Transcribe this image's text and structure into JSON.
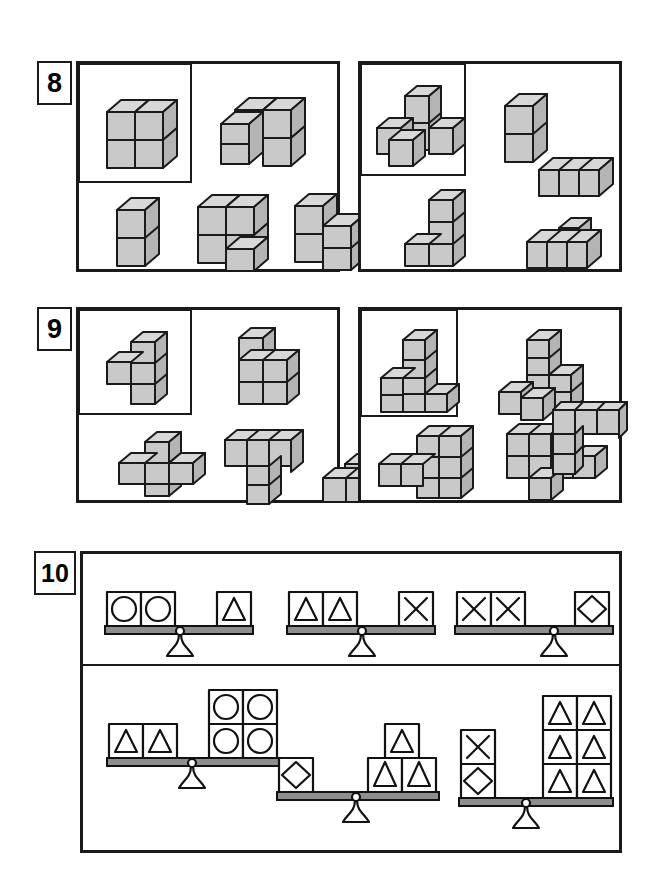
{
  "worksheet": {
    "title": "Spatial reasoning worksheet: cube stacks and balance scales",
    "background": "#ffffff",
    "ink": "#1a1a1a",
    "cube_face_color": "#c9c9c9",
    "cube_top_color": "#d8d8d8",
    "cube_side_color": "#b4b4b4",
    "beam_color": "#909090"
  },
  "problems": [
    {
      "number": "8",
      "label": "8",
      "type": "cube-stacks",
      "panels": [
        {
          "id": "8-left",
          "reference": {
            "name": "2x2x2-cube",
            "description": "solid 2 by 2 by 2 cube of 8 blocks",
            "cubes": [
              [
                0,
                0,
                0
              ],
              [
                1,
                0,
                0
              ],
              [
                0,
                1,
                0
              ],
              [
                1,
                1,
                0
              ],
              [
                0,
                0,
                1
              ],
              [
                1,
                0,
                1
              ],
              [
                0,
                1,
                1
              ],
              [
                1,
                1,
                1
              ]
            ]
          },
          "candidates": [
            {
              "name": "l-shaped-6-block",
              "description": "two stacked blocks with an L-foot, 6 blocks",
              "cubes": [
                [
                  0,
                  0,
                  0
                ],
                [
                  1,
                  0,
                  0
                ],
                [
                  1,
                  1,
                  0
                ],
                [
                  0,
                  0,
                  1
                ],
                [
                  1,
                  0,
                  1
                ],
                [
                  1,
                  1,
                  1
                ]
              ]
            },
            {
              "name": "vertical-domino",
              "description": "two blocks stacked vertically",
              "cubes": [
                [
                  0,
                  0,
                  0
                ],
                [
                  0,
                  0,
                  1
                ]
              ]
            },
            {
              "name": "stair-4-block",
              "description": "three blocks in an L plus one in front, 4 blocks",
              "cubes": [
                [
                  0,
                  0,
                  0
                ],
                [
                  1,
                  0,
                  0
                ],
                [
                  0,
                  0,
                  1
                ],
                [
                  1,
                  0,
                  1
                ]
              ]
            },
            {
              "name": "offset-stack-5-block",
              "description": "column of two with a step at the right",
              "cubes": [
                [
                  0,
                  0,
                  0
                ],
                [
                  0,
                  0,
                  1
                ],
                [
                  1,
                  0,
                  0
                ],
                [
                  1,
                  1,
                  0
                ]
              ]
            }
          ]
        },
        {
          "id": "8-right",
          "reference": {
            "name": "t-tetromino-3d",
            "description": "a tall 2-block column sitting on a row of three blocks",
            "cubes": [
              [
                0,
                0,
                0
              ],
              [
                1,
                0,
                0
              ],
              [
                2,
                0,
                0
              ],
              [
                1,
                0,
                1
              ],
              [
                1,
                0,
                2
              ]
            ]
          },
          "candidates": [
            {
              "name": "vertical-domino",
              "description": "two blocks stacked vertically",
              "cubes": [
                [
                  0,
                  0,
                  0
                ],
                [
                  0,
                  0,
                  1
                ]
              ]
            },
            {
              "name": "row-of-three",
              "description": "three blocks in a straight row",
              "cubes": [
                [
                  0,
                  0,
                  0
                ],
                [
                  1,
                  0,
                  0
                ],
                [
                  2,
                  0,
                  0
                ]
              ]
            },
            {
              "name": "l-column-4-block",
              "description": "column of three with one block at the bottom left",
              "cubes": [
                [
                  1,
                  0,
                  0
                ],
                [
                  1,
                  0,
                  1
                ],
                [
                  1,
                  0,
                  2
                ],
                [
                  0,
                  0,
                  0
                ]
              ]
            },
            {
              "name": "row-of-three-plus-top",
              "description": "row of three blocks with one block on top of the middle",
              "cubes": [
                [
                  0,
                  0,
                  0
                ],
                [
                  1,
                  0,
                  0
                ],
                [
                  2,
                  0,
                  0
                ],
                [
                  1,
                  0,
                  1
                ]
              ]
            }
          ]
        }
      ]
    },
    {
      "number": "9",
      "label": "9",
      "type": "cube-stacks",
      "panels": [
        {
          "id": "9-left",
          "reference": {
            "name": "plus-partial-5-block",
            "description": "vertical column of three with one block to the left of the middle",
            "cubes": [
              [
                1,
                0,
                0
              ],
              [
                1,
                0,
                1
              ],
              [
                1,
                0,
                2
              ],
              [
                0,
                0,
                1
              ]
            ]
          },
          "candidates": [
            {
              "name": "p-shape-5-block",
              "description": "two-by-two square of blocks with one extra on top left",
              "cubes": [
                [
                  0,
                  0,
                  0
                ],
                [
                  1,
                  0,
                  0
                ],
                [
                  0,
                  0,
                  1
                ],
                [
                  1,
                  0,
                  1
                ],
                [
                  0,
                  0,
                  2
                ]
              ]
            },
            {
              "name": "plus-shape-5-block",
              "description": "plus / cross made of five blocks",
              "cubes": [
                [
                  1,
                  0,
                  0
                ],
                [
                  0,
                  0,
                  1
                ],
                [
                  1,
                  0,
                  1
                ],
                [
                  2,
                  0,
                  1
                ],
                [
                  1,
                  0,
                  2
                ]
              ]
            },
            {
              "name": "t-shape-5-block",
              "description": "row of three blocks with a column of two hanging down from the middle",
              "cubes": [
                [
                  0,
                  0,
                  2
                ],
                [
                  1,
                  0,
                  2
                ],
                [
                  2,
                  0,
                  2
                ],
                [
                  1,
                  0,
                  1
                ],
                [
                  1,
                  0,
                  0
                ]
              ]
            },
            {
              "name": "pyramid-3-block",
              "description": "two blocks side by side with one on top",
              "cubes": [
                [
                  0,
                  0,
                  0
                ],
                [
                  1,
                  0,
                  0
                ],
                [
                  1,
                  0,
                  1
                ]
              ]
            }
          ]
        },
        {
          "id": "9-right",
          "reference": {
            "name": "l-block-6",
            "description": "column of three on the left with an L foot of blocks at the base",
            "cubes": [
              [
                0,
                0,
                0
              ],
              [
                1,
                0,
                0
              ],
              [
                2,
                0,
                0
              ],
              [
                0,
                0,
                1
              ],
              [
                0,
                0,
                2
              ],
              [
                1,
                0,
                1
              ]
            ]
          },
          "candidates": [
            {
              "name": "stepped-tower-7-block",
              "description": "tall tower with a lower step and a front block",
              "cubes": [
                [
                  0,
                  0,
                  0
                ],
                [
                  1,
                  0,
                  0
                ],
                [
                  1,
                  0,
                  1
                ],
                [
                  1,
                  0,
                  2
                ],
                [
                  2,
                  0,
                  0
                ],
                [
                  2,
                  0,
                  1
                ],
                [
                  0,
                  1,
                  0
                ]
              ]
            },
            {
              "name": "t-wide-7-block",
              "description": "wide block group with a tall 2x2 section",
              "cubes": [
                [
                  0,
                  0,
                  0
                ],
                [
                  1,
                  0,
                  0
                ],
                [
                  2,
                  0,
                  0
                ],
                [
                  3,
                  0,
                  0
                ],
                [
                  2,
                  0,
                  1
                ],
                [
                  3,
                  0,
                  1
                ],
                [
                  2,
                  0,
                  2
                ],
                [
                  3,
                  0,
                  2
                ]
              ]
            },
            {
              "name": "offset-l-6-block",
              "description": "two-by-two block with a tail of two to the right",
              "cubes": [
                [
                  0,
                  0,
                  1
                ],
                [
                  1,
                  0,
                  1
                ],
                [
                  0,
                  0,
                  2
                ],
                [
                  1,
                  0,
                  2
                ],
                [
                  2,
                  0,
                  1
                ],
                [
                  3,
                  0,
                  1
                ]
              ]
            },
            {
              "name": "corner-l-5-block",
              "description": "row of three on top with two dropping down at the left",
              "cubes": [
                [
                  0,
                  0,
                  1
                ],
                [
                  1,
                  0,
                  1
                ],
                [
                  2,
                  0,
                  1
                ],
                [
                  0,
                  0,
                  0
                ],
                [
                  0,
                  1,
                  0
                ]
              ]
            }
          ]
        }
      ]
    },
    {
      "number": "10",
      "label": "10",
      "type": "balance-scales",
      "rows": [
        {
          "id": "given-equations",
          "scales": [
            {
              "name": "scale-1",
              "left": {
                "layout": "row",
                "cells": [
                  "circle",
                  "circle"
                ]
              },
              "right": {
                "layout": "row",
                "cells": [
                  "triangle"
                ]
              },
              "equation": "2 circles = 1 triangle"
            },
            {
              "name": "scale-2",
              "left": {
                "layout": "row",
                "cells": [
                  "triangle",
                  "triangle"
                ]
              },
              "right": {
                "layout": "row",
                "cells": [
                  "cross"
                ]
              },
              "equation": "2 triangles = 1 cross"
            },
            {
              "name": "scale-3",
              "left": {
                "layout": "row",
                "cells": [
                  "cross",
                  "cross"
                ]
              },
              "right": {
                "layout": "row",
                "cells": [
                  "diamond"
                ]
              },
              "equation": "2 crosses = 1 diamond"
            }
          ]
        },
        {
          "id": "answer-scales",
          "scales": [
            {
              "name": "scale-4",
              "left": {
                "layout": "row",
                "cells": [
                  "triangle",
                  "triangle"
                ]
              },
              "right": {
                "layout": "grid",
                "rows": 2,
                "cols": 2,
                "cells": [
                  "circle",
                  "circle",
                  "circle",
                  "circle"
                ]
              },
              "equation": "2 triangles = 4 circles"
            },
            {
              "name": "scale-5",
              "left": {
                "layout": "row",
                "cells": [
                  "diamond"
                ]
              },
              "right": {
                "layout": "pyramid",
                "cells": [
                  "triangle",
                  "triangle",
                  "triangle"
                ]
              },
              "equation": "1 diamond = 3 triangles"
            },
            {
              "name": "scale-6",
              "left": {
                "layout": "column",
                "cells": [
                  "cross",
                  "diamond"
                ]
              },
              "right": {
                "layout": "grid",
                "rows": 3,
                "cols": 2,
                "cells": [
                  "triangle",
                  "triangle",
                  "triangle",
                  "triangle",
                  "triangle",
                  "triangle"
                ]
              },
              "equation": "1 cross + 1 diamond = 6 triangles"
            }
          ]
        }
      ],
      "symbols": {
        "circle": "circle-shape",
        "triangle": "triangle-shape",
        "cross": "cross-shape",
        "diamond": "diamond-shape"
      }
    }
  ]
}
